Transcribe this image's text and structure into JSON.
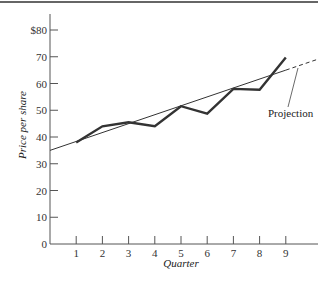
{
  "chart_data": {
    "type": "line",
    "title": "",
    "xlabel": "Quarter",
    "ylabel": "Price per share",
    "x": [
      1,
      2,
      3,
      4,
      5,
      6,
      7,
      8,
      9
    ],
    "x_tick_labels": [
      "1",
      "2",
      "3",
      "4",
      "5",
      "6",
      "7",
      "8",
      "9"
    ],
    "y_tick_labels": [
      "0",
      "10",
      "20",
      "30",
      "40",
      "50",
      "60",
      "70",
      "$80"
    ],
    "y_ticks": [
      0,
      10,
      20,
      30,
      40,
      50,
      60,
      70,
      80
    ],
    "xlim": [
      0,
      10.3
    ],
    "ylim": [
      0,
      85
    ],
    "grid": false,
    "legend": null,
    "series": [
      {
        "name": "Price per share",
        "style": "thick solid",
        "values": [
          38,
          44,
          45.5,
          44,
          51.5,
          48.7,
          58,
          57.7,
          69.7
        ]
      },
      {
        "name": "Trend line",
        "style": "thin solid, dashed beyond quarter 9",
        "x": [
          0,
          9,
          10.2
        ],
        "values": [
          35,
          65,
          69
        ]
      }
    ],
    "annotations": [
      {
        "text": "Projection",
        "points_to": "dashed trend-line extension beyond quarter 9"
      }
    ]
  },
  "labels": {
    "projection": "Projection",
    "xlabel": "Quarter",
    "ylabel": "Price per share"
  }
}
